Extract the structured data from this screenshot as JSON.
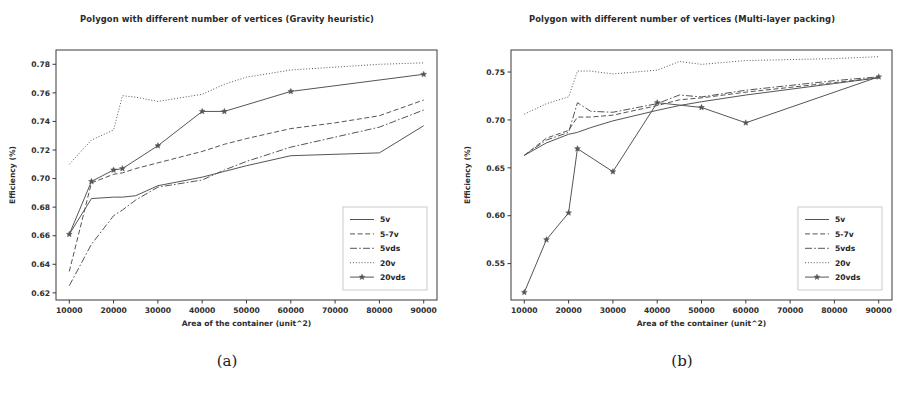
{
  "figures": [
    {
      "caption": "(a)",
      "chart_data": {
        "type": "line",
        "title": "Polygon with different number of vertices (Gravity heuristic)",
        "xlabel": "Area of the container (unit^2)",
        "ylabel": "Efficiency (%)",
        "xlim": [
          7000,
          93000
        ],
        "ylim": [
          0.615,
          0.79
        ],
        "xticks": [
          10000,
          20000,
          30000,
          40000,
          50000,
          60000,
          70000,
          80000,
          90000
        ],
        "yticks": [
          0.62,
          0.64,
          0.66,
          0.68,
          0.7,
          0.72,
          0.74,
          0.76,
          0.78
        ],
        "grid": false,
        "legend_position": "lower right",
        "series": [
          {
            "name": "5v",
            "style": "solid",
            "marker": "none",
            "color": "#555555",
            "x": [
              10000,
              15000,
              20000,
              22000,
              25000,
              30000,
              40000,
              45000,
              50000,
              60000,
              70000,
              80000,
              90000
            ],
            "y": [
              0.661,
              0.686,
              0.687,
              0.687,
              0.688,
              0.695,
              0.701,
              0.705,
              0.709,
              0.716,
              0.717,
              0.718,
              0.737
            ]
          },
          {
            "name": "5-7v",
            "style": "dashed",
            "marker": "none",
            "color": "#555555",
            "x": [
              10000,
              15000,
              20000,
              22000,
              25000,
              30000,
              40000,
              45000,
              50000,
              60000,
              70000,
              80000,
              90000
            ],
            "y": [
              0.635,
              0.697,
              0.703,
              0.704,
              0.707,
              0.711,
              0.719,
              0.724,
              0.728,
              0.735,
              0.739,
              0.744,
              0.755
            ]
          },
          {
            "name": "5vds",
            "style": "dashdot",
            "marker": "none",
            "color": "#555555",
            "x": [
              10000,
              15000,
              20000,
              22000,
              25000,
              30000,
              40000,
              45000,
              50000,
              60000,
              70000,
              80000,
              90000
            ],
            "y": [
              0.625,
              0.654,
              0.674,
              0.678,
              0.685,
              0.694,
              0.699,
              0.706,
              0.712,
              0.722,
              0.729,
              0.736,
              0.748
            ]
          },
          {
            "name": "20v",
            "style": "dotted",
            "marker": "none",
            "color": "#555555",
            "x": [
              10000,
              15000,
              20000,
              22000,
              25000,
              30000,
              40000,
              45000,
              50000,
              60000,
              70000,
              80000,
              90000
            ],
            "y": [
              0.71,
              0.727,
              0.734,
              0.758,
              0.757,
              0.754,
              0.759,
              0.766,
              0.771,
              0.776,
              0.778,
              0.78,
              0.781
            ]
          },
          {
            "name": "20vds",
            "style": "solid",
            "marker": "star",
            "color": "#555555",
            "x": [
              10000,
              15000,
              20000,
              22000,
              30000,
              40000,
              45000,
              60000,
              90000
            ],
            "y": [
              0.661,
              0.698,
              0.706,
              0.707,
              0.723,
              0.747,
              0.747,
              0.761,
              0.773
            ]
          }
        ],
        "legend_entries": [
          "5v",
          "5-7v",
          "5vds",
          "20v",
          "20vds"
        ]
      }
    },
    {
      "caption": "(b)",
      "chart_data": {
        "type": "line",
        "title": "Polygon with different number of vertices (Multi-layer packing)",
        "xlabel": "Area of the container (unit^2)",
        "ylabel": "Efficiency (%)",
        "xlim": [
          7000,
          93000
        ],
        "ylim": [
          0.512,
          0.773
        ],
        "xticks": [
          10000,
          20000,
          30000,
          40000,
          50000,
          60000,
          70000,
          80000,
          90000
        ],
        "yticks": [
          0.55,
          0.6,
          0.65,
          0.7,
          0.75
        ],
        "grid": false,
        "legend_position": "lower right",
        "series": [
          {
            "name": "5v",
            "style": "solid",
            "marker": "none",
            "color": "#555555",
            "x": [
              10000,
              15000,
              20000,
              22000,
              25000,
              30000,
              40000,
              45000,
              50000,
              60000,
              70000,
              80000,
              90000
            ],
            "y": [
              0.663,
              0.676,
              0.685,
              0.687,
              0.692,
              0.699,
              0.71,
              0.715,
              0.719,
              0.726,
              0.732,
              0.738,
              0.744
            ]
          },
          {
            "name": "5-7v",
            "style": "dashed",
            "marker": "none",
            "color": "#555555",
            "x": [
              10000,
              15000,
              20000,
              22000,
              25000,
              30000,
              40000,
              45000,
              50000,
              60000,
              70000,
              80000,
              90000
            ],
            "y": [
              0.663,
              0.681,
              0.689,
              0.703,
              0.703,
              0.705,
              0.715,
              0.721,
              0.723,
              0.729,
              0.734,
              0.739,
              0.744
            ]
          },
          {
            "name": "5vds",
            "style": "dashdot",
            "marker": "none",
            "color": "#555555",
            "x": [
              10000,
              15000,
              20000,
              22000,
              25000,
              30000,
              40000,
              45000,
              50000,
              60000,
              70000,
              80000,
              90000
            ],
            "y": [
              0.663,
              0.679,
              0.687,
              0.718,
              0.709,
              0.708,
              0.717,
              0.726,
              0.724,
              0.731,
              0.736,
              0.741,
              0.745
            ]
          },
          {
            "name": "20v",
            "style": "dotted",
            "marker": "none",
            "color": "#555555",
            "x": [
              10000,
              15000,
              20000,
              22000,
              25000,
              30000,
              40000,
              45000,
              50000,
              60000,
              70000,
              80000,
              90000
            ],
            "y": [
              0.706,
              0.717,
              0.724,
              0.751,
              0.751,
              0.748,
              0.752,
              0.761,
              0.758,
              0.762,
              0.763,
              0.764,
              0.766
            ]
          },
          {
            "name": "20vds",
            "style": "solid",
            "marker": "star",
            "color": "#555555",
            "x": [
              10000,
              15000,
              20000,
              22000,
              30000,
              40000,
              50000,
              60000,
              90000
            ],
            "y": [
              0.52,
              0.575,
              0.603,
              0.67,
              0.646,
              0.718,
              0.713,
              0.697,
              0.745
            ]
          }
        ],
        "legend_entries": [
          "5v",
          "5-7v",
          "5vds",
          "20v",
          "20vds"
        ]
      }
    }
  ]
}
